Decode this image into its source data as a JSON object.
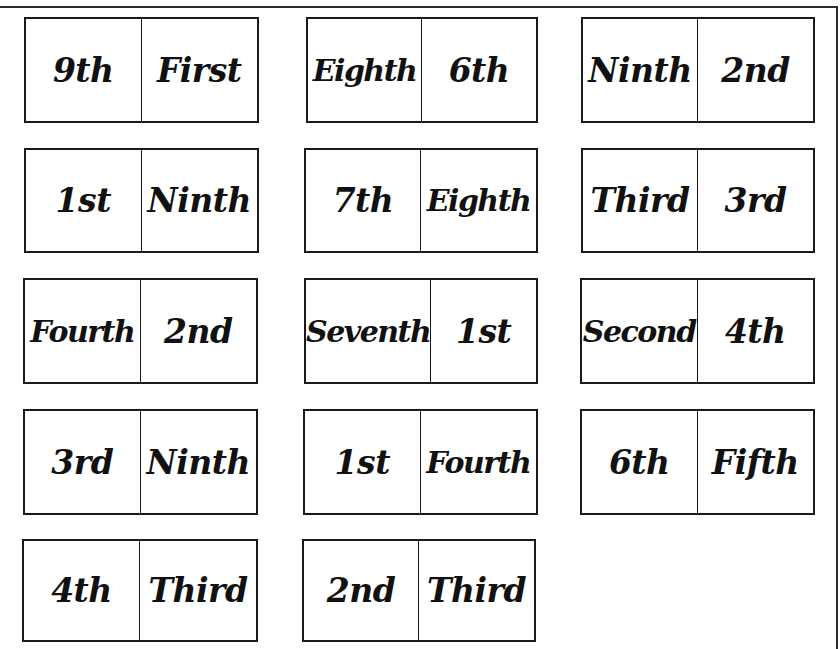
{
  "page": {
    "title_cut": "Copying"
  },
  "cards": [
    {
      "left": "9th",
      "right": "First"
    },
    {
      "left": "Eighth",
      "right": "6th"
    },
    {
      "left": "Ninth",
      "right": "2nd"
    },
    {
      "left": "1st",
      "right": "Ninth"
    },
    {
      "left": "7th",
      "right": "Eighth"
    },
    {
      "left": "Third",
      "right": "3rd"
    },
    {
      "left": "Fourth",
      "right": "2nd"
    },
    {
      "left": "Seventh",
      "right": "1st"
    },
    {
      "left": "Second",
      "right": "4th"
    },
    {
      "left": "3rd",
      "right": "Ninth"
    },
    {
      "left": "1st",
      "right": "Fourth"
    },
    {
      "left": "6th",
      "right": "Fifth"
    },
    {
      "left": "4th",
      "right": "Third"
    },
    {
      "left": "2nd",
      "right": "Third"
    }
  ]
}
